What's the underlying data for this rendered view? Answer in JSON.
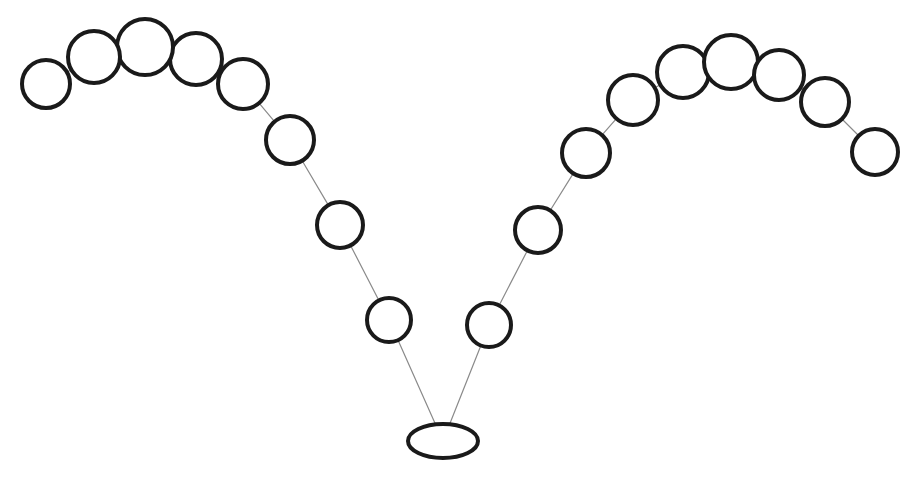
{
  "figure": {
    "background_color": "#ffffff",
    "width": 919,
    "height": 483
  },
  "style": {
    "node_stroke_color": "#1a1a1a",
    "node_fill_color": "#ffffff",
    "node_stroke_width": 4,
    "edge_stroke_color": "#8a8a8a",
    "edge_stroke_width": 1.2,
    "root_stroke_width": 4
  },
  "watermark": {
    "text": ""
  },
  "chart_data": {
    "type": "diagram",
    "subtype": "node-link-tree",
    "xlabel": "",
    "ylabel": "",
    "xlim": [
      0,
      919
    ],
    "ylim": [
      0,
      483
    ],
    "grid": false,
    "legend": "none",
    "node_count": 18,
    "edge_count": 17,
    "nodes": [
      {
        "id": "root",
        "shape": "ellipse",
        "cx": 443,
        "cy": 441,
        "rx": 35,
        "ry": 17,
        "label": ""
      },
      {
        "id": "L1",
        "shape": "circle",
        "cx": 389,
        "cy": 320,
        "r": 22,
        "label": ""
      },
      {
        "id": "L2",
        "shape": "circle",
        "cx": 340,
        "cy": 225,
        "r": 23,
        "label": ""
      },
      {
        "id": "L3",
        "shape": "circle",
        "cx": 290,
        "cy": 140,
        "r": 24,
        "label": ""
      },
      {
        "id": "L4",
        "shape": "circle",
        "cx": 243,
        "cy": 84,
        "r": 25,
        "label": ""
      },
      {
        "id": "L5",
        "shape": "circle",
        "cx": 196,
        "cy": 59,
        "r": 26,
        "label": ""
      },
      {
        "id": "L6",
        "shape": "circle",
        "cx": 145,
        "cy": 47,
        "r": 28,
        "label": ""
      },
      {
        "id": "L7",
        "shape": "circle",
        "cx": 94,
        "cy": 57,
        "r": 26,
        "label": ""
      },
      {
        "id": "L8",
        "shape": "circle",
        "cx": 46,
        "cy": 84,
        "r": 24,
        "label": ""
      },
      {
        "id": "R1",
        "shape": "circle",
        "cx": 489,
        "cy": 325,
        "r": 22,
        "label": ""
      },
      {
        "id": "R2",
        "shape": "circle",
        "cx": 538,
        "cy": 230,
        "r": 23,
        "label": ""
      },
      {
        "id": "R3",
        "shape": "circle",
        "cx": 586,
        "cy": 153,
        "r": 24,
        "label": ""
      },
      {
        "id": "R4",
        "shape": "circle",
        "cx": 633,
        "cy": 100,
        "r": 25,
        "label": ""
      },
      {
        "id": "R5",
        "shape": "circle",
        "cx": 683,
        "cy": 72,
        "r": 26,
        "label": ""
      },
      {
        "id": "R6",
        "shape": "circle",
        "cx": 731,
        "cy": 62,
        "r": 27,
        "label": ""
      },
      {
        "id": "R7",
        "shape": "circle",
        "cx": 779,
        "cy": 75,
        "r": 25,
        "label": ""
      },
      {
        "id": "R8",
        "shape": "circle",
        "cx": 825,
        "cy": 102,
        "r": 24,
        "label": ""
      },
      {
        "id": "R9",
        "shape": "circle",
        "cx": 875,
        "cy": 152,
        "r": 23,
        "label": ""
      }
    ],
    "edges": [
      {
        "from": "root",
        "to": "L1"
      },
      {
        "from": "L1",
        "to": "L2"
      },
      {
        "from": "L2",
        "to": "L3"
      },
      {
        "from": "L3",
        "to": "L4"
      },
      {
        "from": "L4",
        "to": "L5"
      },
      {
        "from": "L5",
        "to": "L6"
      },
      {
        "from": "L6",
        "to": "L7"
      },
      {
        "from": "L7",
        "to": "L8"
      },
      {
        "from": "root",
        "to": "R1"
      },
      {
        "from": "R1",
        "to": "R2"
      },
      {
        "from": "R2",
        "to": "R3"
      },
      {
        "from": "R3",
        "to": "R4"
      },
      {
        "from": "R4",
        "to": "R5"
      },
      {
        "from": "R5",
        "to": "R6"
      },
      {
        "from": "R6",
        "to": "R7"
      },
      {
        "from": "R7",
        "to": "R8"
      },
      {
        "from": "R8",
        "to": "R9"
      }
    ]
  }
}
